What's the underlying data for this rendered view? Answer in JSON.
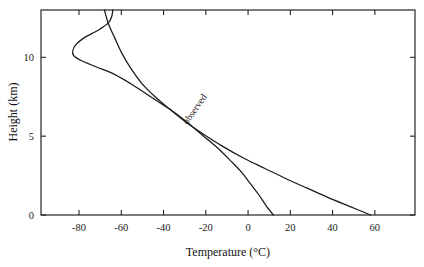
{
  "chart_data": {
    "type": "line",
    "title": "",
    "xlabel": "Temperature  (°C)",
    "ylabel": "Height  (km)",
    "xlim": [
      -98,
      79
    ],
    "ylim": [
      0,
      13
    ],
    "grid": false,
    "legend": "none",
    "xticks": [
      -80,
      -60,
      -40,
      -20,
      0,
      20,
      40,
      60
    ],
    "xticklabels": [
      "-80",
      "-60",
      "-40",
      "-20",
      "0",
      "20",
      "40",
      "60"
    ],
    "yticks": [
      0,
      5,
      10
    ],
    "yticklabels": [
      "0",
      "5",
      "10"
    ],
    "annotations": [
      {
        "text": "observed",
        "x": -24,
        "y": 6.6,
        "rotation": -55
      }
    ],
    "series": [
      {
        "name": "observed",
        "label": "observed",
        "points": [
          {
            "t": 12.0,
            "z": 0.0
          },
          {
            "t": 8.5,
            "z": 0.6
          },
          {
            "t": 5.0,
            "z": 1.3
          },
          {
            "t": 1.0,
            "z": 2.0
          },
          {
            "t": -3.0,
            "z": 2.7
          },
          {
            "t": -8.0,
            "z": 3.4
          },
          {
            "t": -14.0,
            "z": 4.2
          },
          {
            "t": -21.0,
            "z": 5.0
          },
          {
            "t": -29.0,
            "z": 5.9
          },
          {
            "t": -37.0,
            "z": 6.7
          },
          {
            "t": -45.0,
            "z": 7.4
          },
          {
            "t": -54.0,
            "z": 8.2
          },
          {
            "t": -63.0,
            "z": 8.9
          },
          {
            "t": -72.0,
            "z": 9.4
          },
          {
            "t": -79.0,
            "z": 9.8
          },
          {
            "t": -82.5,
            "z": 10.1
          },
          {
            "t": -83.0,
            "z": 10.4
          },
          {
            "t": -81.5,
            "z": 10.8
          },
          {
            "t": -78.0,
            "z": 11.2
          },
          {
            "t": -74.0,
            "z": 11.5
          },
          {
            "t": -70.0,
            "z": 11.8
          },
          {
            "t": -66.0,
            "z": 12.2
          },
          {
            "t": -64.5,
            "z": 12.6
          },
          {
            "t": -64.0,
            "z": 13.0
          }
        ]
      },
      {
        "name": "adiabatic",
        "label": "",
        "points": [
          {
            "t": 58.0,
            "z": 0.0
          },
          {
            "t": 48.0,
            "z": 0.55
          },
          {
            "t": 38.0,
            "z": 1.1
          },
          {
            "t": 28.0,
            "z": 1.7
          },
          {
            "t": 18.0,
            "z": 2.3
          },
          {
            "t": 8.0,
            "z": 2.95
          },
          {
            "t": -2.0,
            "z": 3.6
          },
          {
            "t": -12.0,
            "z": 4.35
          },
          {
            "t": -22.0,
            "z": 5.2
          },
          {
            "t": -30.0,
            "z": 5.95
          },
          {
            "t": -37.0,
            "z": 6.7
          },
          {
            "t": -44.0,
            "z": 7.5
          },
          {
            "t": -50.0,
            "z": 8.3
          },
          {
            "t": -55.0,
            "z": 9.2
          },
          {
            "t": -59.5,
            "z": 10.2
          },
          {
            "t": -63.0,
            "z": 11.2
          },
          {
            "t": -66.0,
            "z": 12.1
          },
          {
            "t": -68.0,
            "z": 13.0
          }
        ]
      }
    ]
  }
}
